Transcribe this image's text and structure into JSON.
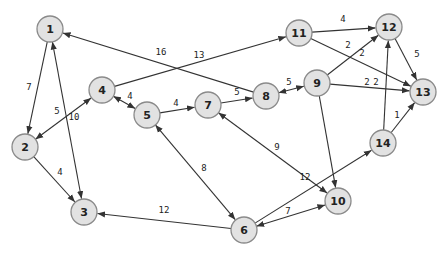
{
  "diagram": {
    "type": "weighted-directed-graph",
    "colors": {
      "node_fill": "#e2e2e2",
      "node_stroke": "#8a8a8a",
      "edge": "#333333",
      "background": "#ffffff"
    },
    "node_radius": 13,
    "nodes": [
      {
        "id": "1",
        "label": "1",
        "x": 50,
        "y": 29
      },
      {
        "id": "2",
        "label": "2",
        "x": 25,
        "y": 147
      },
      {
        "id": "3",
        "label": "3",
        "x": 84,
        "y": 212
      },
      {
        "id": "4",
        "label": "4",
        "x": 102,
        "y": 90
      },
      {
        "id": "5",
        "label": "5",
        "x": 147,
        "y": 115
      },
      {
        "id": "6",
        "label": "6",
        "x": 244,
        "y": 230
      },
      {
        "id": "7",
        "label": "7",
        "x": 208,
        "y": 105
      },
      {
        "id": "8",
        "label": "8",
        "x": 266,
        "y": 96
      },
      {
        "id": "9",
        "label": "9",
        "x": 317,
        "y": 83
      },
      {
        "id": "10",
        "label": "10",
        "x": 338,
        "y": 201
      },
      {
        "id": "11",
        "label": "11",
        "x": 299,
        "y": 33
      },
      {
        "id": "12",
        "label": "12",
        "x": 389,
        "y": 27
      },
      {
        "id": "13",
        "label": "13",
        "x": 423,
        "y": 92
      },
      {
        "id": "14",
        "label": "14",
        "x": 383,
        "y": 143
      }
    ],
    "edges": [
      {
        "from": "1",
        "to": "2",
        "weight": "7",
        "both": false,
        "lx": 29,
        "ly": 87
      },
      {
        "from": "1",
        "to": "3",
        "weight": "10",
        "both": true,
        "lx": 74,
        "ly": 117
      },
      {
        "from": "8",
        "to": "1",
        "weight": "16",
        "both": false,
        "lx": 161,
        "ly": 52
      },
      {
        "from": "2",
        "to": "4",
        "weight": "5",
        "both": true,
        "lx": 57,
        "ly": 111
      },
      {
        "from": "2",
        "to": "3",
        "weight": "4",
        "both": false,
        "lx": 60,
        "ly": 172
      },
      {
        "from": "4",
        "to": "11",
        "weight": "13",
        "both": false,
        "lx": 199,
        "ly": 55
      },
      {
        "from": "4",
        "to": "5",
        "weight": "4",
        "both": true,
        "lx": 130,
        "ly": 96
      },
      {
        "from": "5",
        "to": "7",
        "weight": "4",
        "both": false,
        "lx": 176,
        "ly": 103
      },
      {
        "from": "5",
        "to": "6",
        "weight": "8",
        "both": true,
        "lx": 204,
        "ly": 168
      },
      {
        "from": "6",
        "to": "3",
        "weight": "12",
        "both": false,
        "lx": 164,
        "ly": 210
      },
      {
        "from": "7",
        "to": "8",
        "weight": "5",
        "both": false,
        "lx": 237,
        "ly": 92
      },
      {
        "from": "7",
        "to": "10",
        "weight": "9",
        "both": true,
        "lx": 277,
        "ly": 147
      },
      {
        "from": "8",
        "to": "9",
        "weight": "5",
        "both": true,
        "lx": 289,
        "ly": 82
      },
      {
        "from": "9",
        "to": "12",
        "weight": "2",
        "both": false,
        "lx": 348,
        "ly": 45
      },
      {
        "from": "9",
        "to": "13",
        "weight": "2",
        "both": false,
        "lx": 367,
        "ly": 82
      },
      {
        "from": "9",
        "to": "10",
        "weight": "",
        "both": false,
        "lx": 0,
        "ly": 0
      },
      {
        "from": "11",
        "to": "12",
        "weight": "4",
        "both": false,
        "lx": 343,
        "ly": 19
      },
      {
        "from": "11",
        "to": "13",
        "weight": "2",
        "both": false,
        "lx": 362,
        "ly": 53
      },
      {
        "from": "12",
        "to": "13",
        "weight": "5",
        "both": false,
        "lx": 417,
        "ly": 54
      },
      {
        "from": "14",
        "to": "12",
        "weight": "2",
        "both": false,
        "lx": 376,
        "ly": 82
      },
      {
        "from": "14",
        "to": "13",
        "weight": "1",
        "both": false,
        "lx": 397,
        "ly": 115
      },
      {
        "from": "6",
        "to": "14",
        "weight": "12",
        "both": false,
        "lx": 305,
        "ly": 177
      },
      {
        "from": "6",
        "to": "10",
        "weight": "7",
        "both": true,
        "lx": 288,
        "ly": 211
      }
    ]
  }
}
